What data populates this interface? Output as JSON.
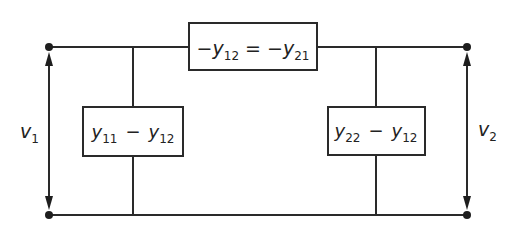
{
  "diagram": {
    "top_element": {
      "minus1": "−",
      "var1": "y",
      "sub1": "12",
      "equals": "=",
      "minus2": "−",
      "var2": "y",
      "sub2": "21"
    },
    "left_shunt": {
      "var1": "y",
      "sub1": "11",
      "minus": "−",
      "var2": "y",
      "sub2": "12"
    },
    "right_shunt": {
      "var1": "y",
      "sub1": "22",
      "minus": "−",
      "var2": "y",
      "sub2": "12"
    },
    "port1": {
      "var": "v",
      "sub": "1"
    },
    "port2": {
      "var": "v",
      "sub": "2"
    },
    "colors": {
      "line": "#2a2a2a",
      "background": "#ffffff"
    }
  }
}
